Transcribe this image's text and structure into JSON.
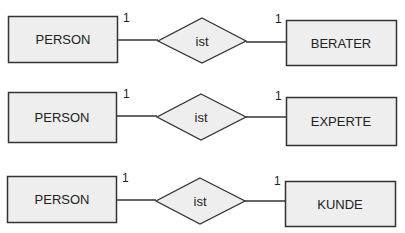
{
  "diagram": {
    "type": "entity-relationship",
    "colors": {
      "fill": "#eeeeee",
      "stroke": "#333333",
      "text": "#222222",
      "background": "#ffffff"
    },
    "rows": [
      {
        "left_entity": "PERSON",
        "relationship": "ist",
        "right_entity": "BERATER",
        "left_cardinality": "1",
        "right_cardinality": "1"
      },
      {
        "left_entity": "PERSON",
        "relationship": "ist",
        "right_entity": "EXPERTE",
        "left_cardinality": "1",
        "right_cardinality": "1"
      },
      {
        "left_entity": "PERSON",
        "relationship": "ist",
        "right_entity": "KUNDE",
        "left_cardinality": "1",
        "right_cardinality": "1"
      }
    ]
  }
}
